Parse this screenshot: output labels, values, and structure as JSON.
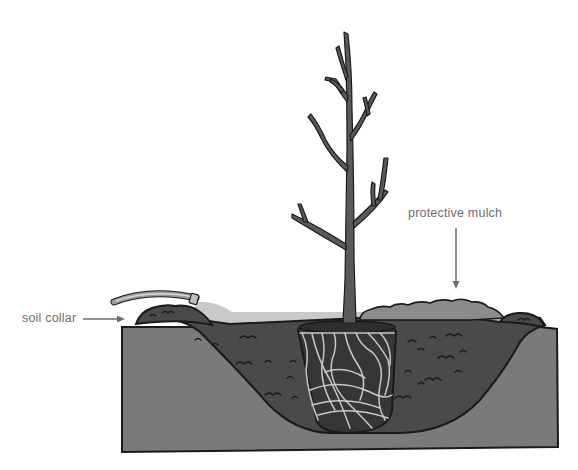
{
  "diagram": {
    "labels": {
      "soil_collar": "soil collar",
      "protective_mulch": "protective mulch"
    },
    "elements": [
      "tree",
      "root-ball",
      "hose",
      "soil-collar",
      "protective-mulch",
      "backfill-soil",
      "native-ground",
      "water-pool"
    ],
    "colors": {
      "background": "#ffffff",
      "native_ground": "#7a7a7a",
      "backfill_soil": "#4a4a4a",
      "root_ball": "#363636",
      "roots": "#c8c8c8",
      "mulch": "#8c8c8c",
      "water": "#c9c9c9",
      "trunk": "#5a5a5a",
      "outline": "#1a1a1a",
      "label_text": "#6e6e6e",
      "arrow": "#6e6e6e"
    }
  }
}
